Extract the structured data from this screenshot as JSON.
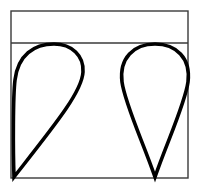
{
  "figure": {
    "background_color": "#ffffff",
    "width": 198,
    "height": 191,
    "frame": {
      "name": "outer-rectangle-frame",
      "x": 11,
      "y": 11,
      "width": 177,
      "height": 167,
      "stroke_color": "#3a3a3a",
      "stroke_width": 1.4,
      "fill": "none"
    },
    "divider": {
      "name": "horizontal-divider-line",
      "x1": 11,
      "y1": 43,
      "x2": 188,
      "y2": 43,
      "stroke_color": "#3a3a3a",
      "stroke_width": 1.4
    },
    "top_band": {
      "name": "empty-top-band",
      "label": "",
      "x": 11,
      "y": 11,
      "width": 177,
      "height": 32,
      "fill": "#ffffff"
    },
    "shapes": [
      {
        "name": "left-teardrop",
        "orientation": "tilted-left",
        "description": "Slanted teardrop with sharp point at bottom-left corner and rounded bulb toward upper right",
        "tip_x": 14,
        "tip_y": 177,
        "bulb_top_x": 52,
        "bulb_top_y": 44,
        "bulb_left_x": 14,
        "bulb_right_x": 81,
        "stroke_color": "#000000",
        "stroke_width": 3.6,
        "fill": "none",
        "path": "M 14 177 C 13 150 13 96 15 80 C 18 55 34 44 54 44 C 72 44 84 56 83 72 C 82 92 54 126 14 177 Z"
      },
      {
        "name": "right-teardrop",
        "orientation": "upright",
        "description": "Symmetric upright pin-shaped teardrop with sharp point at bottom and round bulb on top",
        "tip_x": 155,
        "tip_y": 177,
        "bulb_top_x": 155,
        "bulb_top_y": 44,
        "bulb_left_x": 122,
        "bulb_right_x": 188,
        "stroke_color": "#000000",
        "stroke_width": 3.6,
        "fill": "none",
        "path": "M 155 177 C 143 142 125 104 122 82 C 119 58 134 44 155 44 C 176 44 191 58 188 82 C 185 104 167 142 155 177 Z"
      }
    ]
  }
}
